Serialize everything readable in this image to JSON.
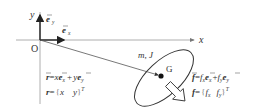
{
  "diagram": {
    "type": "rigid-body kinematics diagram",
    "axes": {
      "x_label": "x",
      "y_label": "y",
      "origin_label": "O"
    },
    "unit_vectors": {
      "ex_label": "e",
      "ex_sub": "x",
      "ey_label": "e",
      "ey_sub": "y"
    },
    "body": {
      "properties_label": "m, J",
      "centroid_label": "G"
    },
    "position_equations": {
      "vector_form": {
        "lhs": "r",
        "eq": "=",
        "t1_coef": "x",
        "t1_vec": "e",
        "t1_sub": "x",
        "plus": "+",
        "t2_coef": "y",
        "t2_vec": "e",
        "t2_sub": "y"
      },
      "matrix_form": {
        "lhs": "r",
        "eq": "=",
        "open": "{",
        "c1": "x",
        "c2": "y",
        "close": "}",
        "sup": "T"
      }
    },
    "force_equations": {
      "vector_form": {
        "lhs": "f",
        "eq": "=",
        "t1_coef": "f",
        "t1_coef_sub": "x",
        "t1_vec": "e",
        "t1_sub": "x",
        "plus": "+",
        "t2_coef": "f",
        "t2_coef_sub": "y",
        "t2_vec": "e",
        "t2_sub": "y"
      },
      "matrix_form": {
        "lhs": "f",
        "eq": "=",
        "open": "{",
        "c1": "f",
        "c1_sub": "x",
        "c2": "f",
        "c2_sub": "y",
        "close": "}",
        "sup": "T"
      }
    },
    "colors": {
      "line": "#555555",
      "axis": "#888888",
      "text": "#333333",
      "dot": "#111111"
    }
  }
}
